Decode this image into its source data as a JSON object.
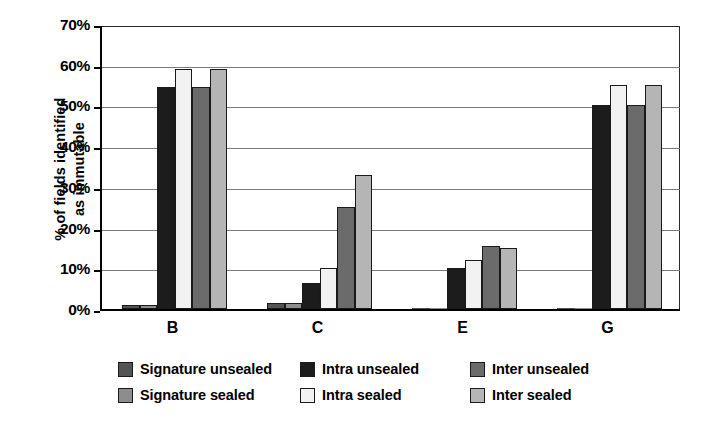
{
  "chart_data": {
    "type": "bar",
    "title": "",
    "xlabel": "",
    "ylabel": "% of fields identified\nas immutable",
    "categories": [
      "B",
      "C",
      "E",
      "G"
    ],
    "series": [
      {
        "name": "Signature unsealed",
        "color": "#545454",
        "values": [
          1,
          1.5,
          0,
          0
        ]
      },
      {
        "name": "Signature sealed",
        "color": "#8d8d8d",
        "values": [
          1,
          1.5,
          0,
          0
        ]
      },
      {
        "name": "Intra unsealed",
        "color": "#1c1c1c",
        "values": [
          54.5,
          6.5,
          10,
          50
        ]
      },
      {
        "name": "Intra sealed",
        "color": "#f2f2f2",
        "values": [
          59,
          10,
          12,
          55
        ]
      },
      {
        "name": "Inter unsealed",
        "color": "#6b6b6b",
        "values": [
          54.5,
          25,
          15.5,
          50
        ]
      },
      {
        "name": "Inter sealed",
        "color": "#b5b5b5",
        "values": [
          59,
          33,
          15,
          55
        ]
      }
    ],
    "ylim": [
      0,
      70
    ],
    "ytick_values": [
      0,
      10,
      20,
      30,
      40,
      50,
      60,
      70
    ],
    "ytick_labels": [
      "0%",
      "10%",
      "20%",
      "30%",
      "40%",
      "50%",
      "60%",
      "70%"
    ],
    "grid": "horizontal",
    "legend_position": "bottom",
    "legend_columns": 3,
    "legend_order": [
      "Signature unsealed",
      "Intra unsealed",
      "Inter unsealed",
      "Signature sealed",
      "Intra sealed",
      "Inter sealed"
    ]
  }
}
